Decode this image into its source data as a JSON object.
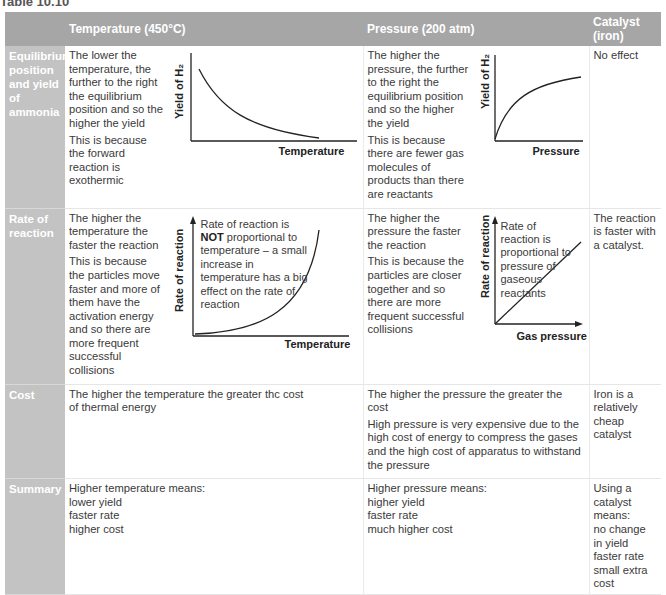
{
  "title": "Table 10.10",
  "columns": [
    "",
    "Temperature (450°C)",
    "Pressure (200 atm)",
    "Catalyst (iron)"
  ],
  "rows": [
    {
      "label": "Equilibrium position and yield of ammonia",
      "temperature": {
        "lines": [
          "The lower the temperature, the further to the right the equilibrium position and so the higher the yield",
          "This is because the forward reaction is exothermic"
        ],
        "graph": {
          "ylabel": "Yield of H₂",
          "xlabel": "Temperature",
          "shape": "decreasing-curve"
        }
      },
      "pressure": {
        "lines": [
          "The higher the pressure, the further to the right the equilibrium position and so the higher the yield",
          "This is because there are fewer gas molecules of products than there are reactants"
        ],
        "graph": {
          "ylabel": "Yield of H₂",
          "xlabel": "Pressure",
          "shape": "increasing-saturating-curve"
        }
      },
      "catalyst": "No effect"
    },
    {
      "label": "Rate of reaction",
      "temperature": {
        "lines": [
          "The higher the temperature the faster the reaction",
          "This is because the particles move faster and more of them have the activation energy and so there are more frequent successful collisions"
        ],
        "graph": {
          "ylabel": "Rate of reaction",
          "xlabel": "Temperature",
          "note_bold": "NOT",
          "note_pre": "Rate of reaction is",
          "note_post": "proportional to temperature – a small increase in temperature has a big effect on the rate of reaction",
          "shape": "exponential-curve"
        }
      },
      "pressure": {
        "lines": [
          "The higher the pressure the faster the reaction",
          "This is because the particles are closer together and so there are more frequent successful collisions"
        ],
        "graph": {
          "ylabel": "Rate of reaction",
          "xlabel": "Gas pressure",
          "note": "Rate of reaction is proportional to pressure of gaseous reactants",
          "shape": "straight-line"
        }
      },
      "catalyst": "The reaction is faster with a catalyst."
    },
    {
      "label": "Cost",
      "temperature": {
        "lines": [
          "The higher the temperature the greater thc cost of thermal energy"
        ]
      },
      "pressure": {
        "lines": [
          "The higher the pressure the greater the cost",
          "High pressure is very expensive due to the high cost of energy to compress the gases and the high cost of apparatus to withstand the pressure"
        ]
      },
      "catalyst": "Iron is a relatively cheap catalyst"
    },
    {
      "label": "Summary",
      "temperature": {
        "lines": [
          "Higher temperature means:",
          "lower yield",
          "faster rate",
          "higher cost"
        ]
      },
      "pressure": {
        "lines": [
          "Higher pressure means:",
          "higher yield",
          "faster rate",
          "much higher cost"
        ]
      },
      "catalyst_lines": [
        "Using a catalyst means:",
        "no change in yield",
        "faster rate",
        "small extra cost"
      ]
    }
  ]
}
